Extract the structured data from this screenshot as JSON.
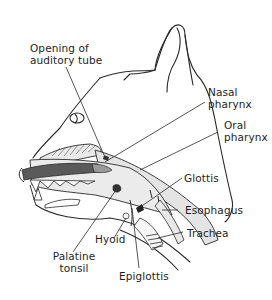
{
  "diagram": {
    "colors": {
      "outline": "#2a2a2a",
      "tissue_fill": "#e6e6e6",
      "tongue_dark": "#5a5a5a",
      "tongue_tip": "#9a9a9a",
      "background": "#ffffff"
    },
    "labels": [
      {
        "id": "opening-auditory-tube",
        "line1": "Opening of",
        "line2": "auditory tube"
      },
      {
        "id": "nasal-pharynx",
        "line1": "Nasal",
        "line2": "pharynx"
      },
      {
        "id": "oral-pharynx",
        "line1": "Oral",
        "line2": "pharynx"
      },
      {
        "id": "glottis",
        "line1": "Glottis"
      },
      {
        "id": "esophagus",
        "line1": "Esophagus"
      },
      {
        "id": "trachea",
        "line1": "Trachea"
      },
      {
        "id": "hyoid",
        "line1": "Hyoid"
      },
      {
        "id": "palatine-tonsil",
        "line1": "Palatine",
        "line2": "tonsil"
      },
      {
        "id": "epiglottis",
        "line1": "Epiglottis"
      }
    ]
  }
}
